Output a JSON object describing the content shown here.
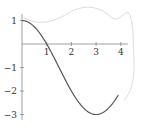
{
  "chart_data": {
    "type": "line",
    "title": "",
    "xlabel": "",
    "ylabel": "",
    "function": "2cos(pi*x/3) - 1",
    "x": [
      0,
      0.5,
      1,
      1.5,
      2,
      2.5,
      3,
      3.5,
      3.9
    ],
    "series": [
      {
        "name": "f(x)",
        "values": [
          1,
          0.73,
          0,
          -1,
          -2,
          -2.73,
          -3,
          -2.73,
          -2.21
        ],
        "color": "#555555"
      }
    ],
    "xticks": [
      "1",
      "2",
      "3",
      "4"
    ],
    "yticks": [
      "1",
      "-1",
      "-2",
      "-3"
    ],
    "xlim": [
      0,
      4.2
    ],
    "ylim": [
      -3.1,
      1.1
    ],
    "grid": false,
    "legend": null
  },
  "colors": {
    "axis": "#888888",
    "curve": "#555555",
    "sketch": "#dddddd"
  }
}
